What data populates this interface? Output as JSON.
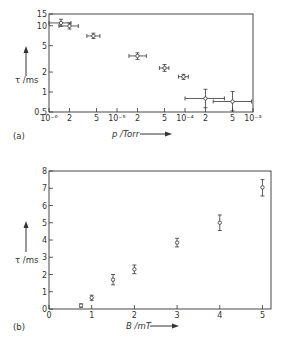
{
  "chart_data": [
    {
      "panel": "(a)",
      "type": "scatter",
      "xscale": "log",
      "yscale": "log",
      "xlabel": "p / Torr",
      "ylabel": "τ / ms",
      "xlim": [
        1e-06,
        0.001
      ],
      "ylim": [
        0.5,
        15
      ],
      "xtick_labels": [
        "10⁻⁶",
        "2",
        "5",
        "10⁻⁵",
        "2",
        "5",
        "10⁻⁴",
        "2",
        "5",
        "10⁻³"
      ],
      "xticks": [
        1e-06,
        2e-06,
        5e-06,
        1e-05,
        2e-05,
        5e-05,
        0.0001,
        0.0002,
        0.0005,
        0.001
      ],
      "ytick_labels": [
        "0.5",
        "1",
        "2",
        "5",
        "10",
        "15"
      ],
      "yticks": [
        0.5,
        1,
        2,
        5,
        10,
        15
      ],
      "grid": false,
      "points": [
        {
          "x": 1.5e-06,
          "y": 11.0,
          "xerr": [
            1e-06,
            2.1e-06
          ],
          "yerr": [
            9.8,
            12.5
          ]
        },
        {
          "x": 2e-06,
          "y": 9.9,
          "xerr": [
            1.4e-06,
            2.7e-06
          ],
          "yerr": [
            8.9,
            11.0
          ]
        },
        {
          "x": 4.5e-06,
          "y": 7.0,
          "xerr": [
            3.6e-06,
            5.6e-06
          ],
          "yerr": [
            6.4,
            7.7
          ]
        },
        {
          "x": 2e-05,
          "y": 3.5,
          "xerr": [
            1.5e-05,
            2.7e-05
          ],
          "yerr": [
            3.1,
            3.9
          ]
        },
        {
          "x": 5e-05,
          "y": 2.3,
          "xerr": [
            4.2e-05,
            5.8e-05
          ],
          "yerr": [
            2.05,
            2.6
          ]
        },
        {
          "x": 9.5e-05,
          "y": 1.7,
          "xerr": [
            8e-05,
            0.000112
          ],
          "yerr": [
            1.55,
            1.85
          ]
        },
        {
          "x": 0.0002,
          "y": 0.8,
          "xerr": [
            0.0001,
            0.00038
          ],
          "yerr": [
            0.58,
            1.1
          ]
        },
        {
          "x": 0.0005,
          "y": 0.72,
          "xerr": [
            0.00026,
            0.00095
          ],
          "yerr": [
            0.52,
            1.02
          ]
        }
      ]
    },
    {
      "panel": "(b)",
      "type": "scatter",
      "xscale": "linear",
      "yscale": "linear",
      "xlabel": "B / mT",
      "ylabel": "τ / ms",
      "xlim": [
        0,
        5.2
      ],
      "ylim": [
        0,
        8
      ],
      "xticks": [
        0,
        1,
        2,
        3,
        4,
        5
      ],
      "xtick_labels": [
        "0",
        "1",
        "2",
        "3",
        "4",
        "5"
      ],
      "yticks": [
        0,
        1,
        2,
        3,
        4,
        5,
        6,
        7,
        8
      ],
      "ytick_labels": [
        "0",
        "1",
        "2",
        "3",
        "4",
        "5",
        "6",
        "7",
        "8"
      ],
      "grid": false,
      "points": [
        {
          "x": 0.75,
          "y": 0.2,
          "yerr": [
            0.1,
            0.3
          ]
        },
        {
          "x": 1.0,
          "y": 0.65,
          "yerr": [
            0.5,
            0.8
          ]
        },
        {
          "x": 1.5,
          "y": 1.7,
          "yerr": [
            1.4,
            2.0
          ]
        },
        {
          "x": 2.0,
          "y": 2.3,
          "yerr": [
            2.05,
            2.55
          ]
        },
        {
          "x": 3.0,
          "y": 3.85,
          "yerr": [
            3.6,
            4.1
          ]
        },
        {
          "x": 4.0,
          "y": 5.0,
          "yerr": [
            4.55,
            5.45
          ]
        },
        {
          "x": 5.0,
          "y": 7.05,
          "yerr": [
            6.55,
            7.5
          ]
        }
      ]
    }
  ],
  "panels": {
    "a": {
      "label": "(a)",
      "xlabel": "p /Torr",
      "ylabel": "τ /ms"
    },
    "b": {
      "label": "(b)",
      "xlabel": "B /mT",
      "ylabel": "τ /ms"
    }
  },
  "style": {
    "ink": "#333333",
    "background": "#ffffff"
  }
}
